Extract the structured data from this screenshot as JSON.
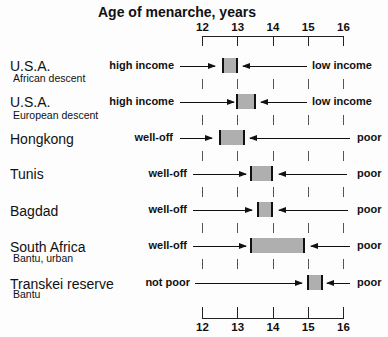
{
  "chart_data": {
    "type": "range-bar",
    "title": "Age of menarche, years",
    "xlabel": "Age of menarche, years",
    "ylabel": "",
    "xlim": [
      12,
      16
    ],
    "x_ticks": [
      "12",
      "13",
      "14",
      "15",
      "16"
    ],
    "grid": false,
    "axes": [
      "top",
      "bottom"
    ],
    "rows": [
      {
        "name": "U.S.A.",
        "subname": "African descent",
        "range": [
          12.6,
          13.0
        ],
        "left_label": "high income",
        "right_label": "low income"
      },
      {
        "name": "U.S.A.",
        "subname": "European descent",
        "range": [
          13.0,
          13.5
        ],
        "left_label": "high income",
        "right_label": "low  income"
      },
      {
        "name": "Hongkong",
        "subname": "",
        "range": [
          12.5,
          13.2
        ],
        "left_label": "well-off",
        "right_label": "poor"
      },
      {
        "name": "Tunis",
        "subname": "",
        "range": [
          13.4,
          14.0
        ],
        "left_label": "well-off",
        "right_label": "poor"
      },
      {
        "name": "Bagdad",
        "subname": "",
        "range": [
          13.6,
          14.0
        ],
        "left_label": "well-off",
        "right_label": "poor"
      },
      {
        "name": "South Africa",
        "subname": "Bantu, urban",
        "range": [
          13.4,
          14.9
        ],
        "left_label": "well-off",
        "right_label": "poor"
      },
      {
        "name": "Transkei reserve",
        "subname": "Bantu",
        "range": [
          15.0,
          15.4
        ],
        "left_label": "not poor",
        "right_label": "poor"
      }
    ]
  },
  "colors": {
    "ink": "#111111",
    "box_fill": "#cfcfcf",
    "background": "#fdfdfd"
  }
}
